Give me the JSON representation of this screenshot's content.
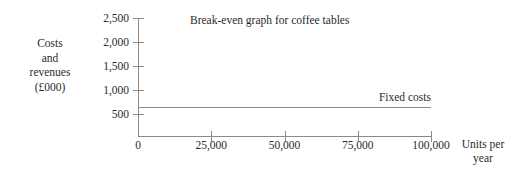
{
  "chart_data": {
    "type": "line",
    "title": "Break-even graph for coffee tables",
    "xlabel_line1": "Units per",
    "xlabel_line2": "year",
    "ylabel_line1": "Costs",
    "ylabel_line2": "and",
    "ylabel_line3": "revenues",
    "ylabel_line4": "(£000)",
    "xlim": [
      0,
      100000
    ],
    "ylim": [
      0,
      2500
    ],
    "grid": false,
    "legend": "none",
    "x_ticks": [
      {
        "value": 0,
        "label": "0"
      },
      {
        "value": 25000,
        "label": "25,000"
      },
      {
        "value": 50000,
        "label": "50,000"
      },
      {
        "value": 75000,
        "label": "75,000"
      },
      {
        "value": 100000,
        "label": "100,000"
      }
    ],
    "y_ticks": [
      {
        "value": 2500,
        "label": "2,500"
      },
      {
        "value": 2000,
        "label": "2,000"
      },
      {
        "value": 1500,
        "label": "1,500"
      },
      {
        "value": 1000,
        "label": "1,000"
      },
      {
        "value": 500,
        "label": "500"
      }
    ],
    "series": [
      {
        "name": "Fixed costs",
        "annotation": "Fixed costs",
        "x": [
          0,
          100000
        ],
        "values": [
          650,
          650
        ],
        "color": "#8a8a8a"
      }
    ],
    "axis_color": "#8a8a8a",
    "text_color": "#2b2b2b",
    "background": "#ffffff"
  }
}
